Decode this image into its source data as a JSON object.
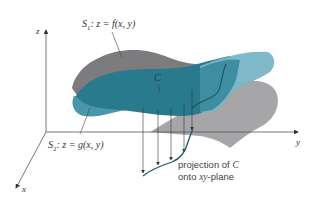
{
  "diagram": {
    "type": "3d-surfaces-intersection",
    "axes": {
      "z_label": "z",
      "y_label": "y",
      "x_label": "x"
    },
    "surfaces": {
      "s1": {
        "name": "S",
        "subscript": "1",
        "equation": ": z = f(x, y)",
        "color": "#7c7c7e"
      },
      "s2": {
        "name": "S",
        "subscript": "2",
        "equation": ": z = g(x, y)",
        "color": "#2e7f93"
      }
    },
    "curve": {
      "label": "C",
      "color": "#1d5a6c"
    },
    "projection": {
      "line1": "projection of",
      "curve_ref": "C",
      "line2_prefix": "onto ",
      "plane_ref": "xy",
      "line2_suffix": "-plane"
    },
    "colors": {
      "gray_surface": "#7c7c7e",
      "gray_surface_light": "#a9a9ab",
      "teal_dark": "#2a7a8e",
      "teal_light": "#6fb0c3",
      "axis": "#555555",
      "curve": "#1d5a6c"
    }
  }
}
